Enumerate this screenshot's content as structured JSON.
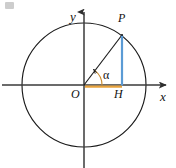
{
  "figure": {
    "background_color": "#ffffff",
    "width": 176,
    "height": 168
  },
  "labels": {
    "y_axis": "y",
    "x_axis": "x",
    "point_p": "P",
    "origin": "O",
    "foot_h": "H",
    "angle": "α"
  },
  "colors": {
    "stroke": "#1a1a1a",
    "axis": "#3a3a3a",
    "perpendicular": "#5b9bd5",
    "base_segment": "#e8a33d",
    "arc": "#c98a2e",
    "text": "#111111"
  },
  "geometry": {
    "center": {
      "x": 84,
      "y": 85
    },
    "radius": 62,
    "point_p": {
      "x": 122,
      "y": 35
    },
    "point_h": {
      "x": 122,
      "y": 85
    },
    "angle_degrees": 53,
    "y_axis": {
      "x": 84,
      "top": 6,
      "bottom": 168
    },
    "x_axis": {
      "y": 85,
      "left": 2,
      "right": 170
    }
  }
}
